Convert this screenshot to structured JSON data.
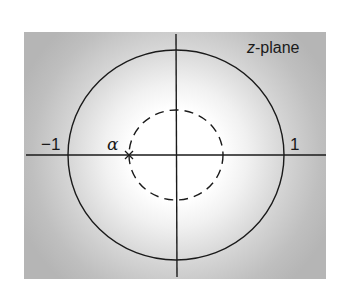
{
  "diagram": {
    "title_label": "z-plane",
    "title_italic": "z",
    "title_rest": "-plane",
    "labels": {
      "neg_one": "−1",
      "pos_one": "1",
      "alpha": "α"
    },
    "elements": {
      "unit_circle": {
        "style": "solid",
        "radius_value": 1
      },
      "inner_circle": {
        "style": "dashed",
        "passes_through": "alpha"
      },
      "pole_marker": {
        "symbol": "×",
        "location": "alpha",
        "on_axis": "real"
      },
      "shading": "region |z| > |alpha| shaded, darkening outward"
    },
    "colors": {
      "background_outer": "#b9b9b9",
      "background_inner": "#ffffff",
      "lines": "#1a1a1a"
    }
  }
}
